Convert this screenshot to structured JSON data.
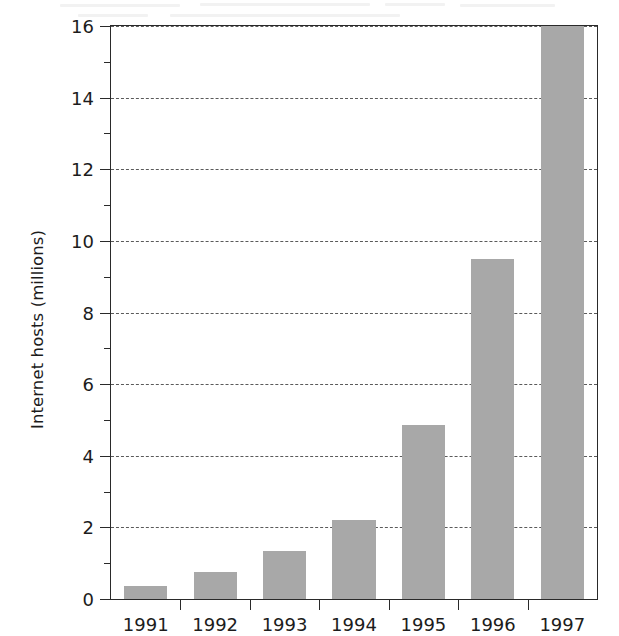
{
  "chart_data": {
    "type": "bar",
    "title": "",
    "subtitle": "",
    "xlabel": "",
    "ylabel": "Internet hosts (millions)",
    "categories": [
      "1991",
      "1992",
      "1993",
      "1994",
      "1995",
      "1996",
      "1997"
    ],
    "values": [
      0.35,
      0.75,
      1.35,
      2.2,
      4.85,
      9.5,
      16.0
    ],
    "ylim": [
      0,
      16
    ],
    "ytick_step": 2,
    "ytick_labels": [
      "0",
      "2",
      "4",
      "6",
      "8",
      "10",
      "12",
      "14",
      "16"
    ],
    "yminor_ticks": [
      1,
      3,
      5,
      7,
      9,
      11,
      13,
      15
    ],
    "xtick_labels": [
      "1991",
      "1992",
      "1993",
      "1994",
      "1995",
      "1996",
      "1997"
    ],
    "grid": "horizontal-dashed",
    "legend": "none",
    "bar_color": "#a8a8a8",
    "axis_color": "#2a2a2a",
    "grid_color": "#5a5a5a",
    "background_color": "#ffffff"
  }
}
